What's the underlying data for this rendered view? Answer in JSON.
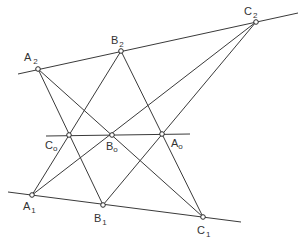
{
  "diagram": {
    "colors": {
      "line": "#3a3a3a",
      "point_fill": "#ffffff",
      "label": "#333333"
    },
    "points": {
      "A2": {
        "label": "A",
        "sub": "2",
        "x": 38,
        "y": 69
      },
      "B2": {
        "label": "B",
        "sub": "2",
        "x": 121,
        "y": 51
      },
      "C2": {
        "label": "C",
        "sub": "2",
        "x": 256,
        "y": 22
      },
      "C0": {
        "label": "C",
        "sub": "o",
        "x": 69,
        "y": 135
      },
      "B0": {
        "label": "B",
        "sub": "o",
        "x": 112,
        "y": 135
      },
      "A0": {
        "label": "A",
        "sub": "o",
        "x": 162,
        "y": 134
      },
      "A1": {
        "label": "A",
        "sub": "1",
        "x": 32,
        "y": 195
      },
      "B1": {
        "label": "B",
        "sub": "1",
        "x": 103,
        "y": 205
      },
      "C1": {
        "label": "C",
        "sub": "1",
        "x": 203,
        "y": 217
      }
    },
    "lines": [
      {
        "name": "line-top",
        "through": [
          "A2",
          "B2",
          "C2"
        ]
      },
      {
        "name": "line-middle",
        "through": [
          "C0",
          "B0",
          "A0"
        ]
      },
      {
        "name": "line-bottom",
        "through": [
          "A1",
          "B1",
          "C1"
        ]
      },
      {
        "name": "line-A2-B1",
        "through": [
          "A2",
          "C0",
          "B1"
        ]
      },
      {
        "name": "line-A2-C1",
        "through": [
          "A2",
          "B0",
          "C1"
        ]
      },
      {
        "name": "line-B2-A1",
        "through": [
          "B2",
          "C0",
          "A1"
        ]
      },
      {
        "name": "line-B2-C1",
        "through": [
          "B2",
          "A0",
          "C1"
        ]
      },
      {
        "name": "line-C2-A1",
        "through": [
          "C2",
          "B0",
          "A1"
        ]
      },
      {
        "name": "line-C2-B1",
        "through": [
          "C2",
          "A0",
          "B1"
        ]
      }
    ]
  }
}
